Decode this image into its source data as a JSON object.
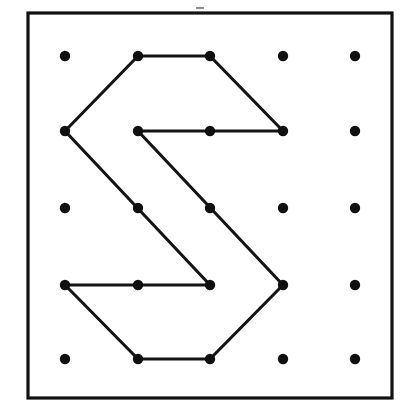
{
  "figure": {
    "canvas": {
      "width": 409,
      "height": 418
    },
    "background_color": "#ffffff",
    "ink_color": "#141414",
    "border": {
      "name": "board-border",
      "x": 28,
      "y": 13,
      "width": 364,
      "height": 385,
      "stroke_color": "#111111",
      "stroke_width": 3.2,
      "fill": "#ffffff"
    },
    "grid": {
      "rows": 5,
      "columns": 5,
      "column_x": [
        65,
        138,
        210,
        283,
        355
      ],
      "row_y": [
        56,
        131,
        208,
        285,
        359
      ],
      "dot_radius": 5.2,
      "dot_color": "#101010",
      "column_spacing": 72.5,
      "row_spacing": 75.75
    },
    "dots": [
      {
        "id": "r1c1",
        "row": 1,
        "col": 1,
        "x": 65,
        "y": 56,
        "on_path": false
      },
      {
        "id": "r1c2",
        "row": 1,
        "col": 2,
        "x": 138,
        "y": 56,
        "on_path": true
      },
      {
        "id": "r1c3",
        "row": 1,
        "col": 3,
        "x": 210,
        "y": 56,
        "on_path": true
      },
      {
        "id": "r1c4",
        "row": 1,
        "col": 4,
        "x": 283,
        "y": 56,
        "on_path": false
      },
      {
        "id": "r1c5",
        "row": 1,
        "col": 5,
        "x": 355,
        "y": 56,
        "on_path": false
      },
      {
        "id": "r2c1",
        "row": 2,
        "col": 1,
        "x": 65,
        "y": 131,
        "on_path": true
      },
      {
        "id": "r2c2",
        "row": 2,
        "col": 2,
        "x": 138,
        "y": 131,
        "on_path": true
      },
      {
        "id": "r2c3",
        "row": 2,
        "col": 3,
        "x": 210,
        "y": 131,
        "on_path": true
      },
      {
        "id": "r2c4",
        "row": 2,
        "col": 4,
        "x": 283,
        "y": 131,
        "on_path": true
      },
      {
        "id": "r2c5",
        "row": 2,
        "col": 5,
        "x": 355,
        "y": 131,
        "on_path": false
      },
      {
        "id": "r3c1",
        "row": 3,
        "col": 1,
        "x": 65,
        "y": 208,
        "on_path": false
      },
      {
        "id": "r3c2",
        "row": 3,
        "col": 2,
        "x": 138,
        "y": 208,
        "on_path": true
      },
      {
        "id": "r3c3",
        "row": 3,
        "col": 3,
        "x": 210,
        "y": 208,
        "on_path": true
      },
      {
        "id": "r3c4",
        "row": 3,
        "col": 4,
        "x": 283,
        "y": 208,
        "on_path": false
      },
      {
        "id": "r3c5",
        "row": 3,
        "col": 5,
        "x": 355,
        "y": 208,
        "on_path": false
      },
      {
        "id": "r4c1",
        "row": 4,
        "col": 1,
        "x": 65,
        "y": 285,
        "on_path": true
      },
      {
        "id": "r4c2",
        "row": 4,
        "col": 2,
        "x": 138,
        "y": 285,
        "on_path": true
      },
      {
        "id": "r4c3",
        "row": 4,
        "col": 3,
        "x": 210,
        "y": 285,
        "on_path": true
      },
      {
        "id": "r4c4",
        "row": 4,
        "col": 4,
        "x": 283,
        "y": 285,
        "on_path": true
      },
      {
        "id": "r4c5",
        "row": 4,
        "col": 5,
        "x": 355,
        "y": 285,
        "on_path": false
      },
      {
        "id": "r5c1",
        "row": 5,
        "col": 1,
        "x": 65,
        "y": 359,
        "on_path": false
      },
      {
        "id": "r5c2",
        "row": 5,
        "col": 2,
        "x": 138,
        "y": 359,
        "on_path": true
      },
      {
        "id": "r5c3",
        "row": 5,
        "col": 3,
        "x": 210,
        "y": 359,
        "on_path": true
      },
      {
        "id": "r5c4",
        "row": 5,
        "col": 4,
        "x": 283,
        "y": 359,
        "on_path": false
      },
      {
        "id": "r5c5",
        "row": 5,
        "col": 5,
        "x": 355,
        "y": 359,
        "on_path": false
      }
    ],
    "polygon": {
      "name": "rubber-band-path",
      "closed": true,
      "stroke_color": "#141414",
      "stroke_width": 3.1,
      "vertex_ids": [
        "r1c2",
        "r1c3",
        "r2c4",
        "r2c2",
        "r4c4",
        "r5c3",
        "r5c2",
        "r4c1",
        "r4c3",
        "r2c1"
      ],
      "points": "138,56 210,56 283,131 138,131 283,285 210,359 138,359 65,285 210,285 65,131",
      "segments": [
        {
          "from": "r1c2",
          "to": "r1c3",
          "x1": 138,
          "y1": 56,
          "x2": 210,
          "y2": 56
        },
        {
          "from": "r1c3",
          "to": "r2c4",
          "x1": 210,
          "y1": 56,
          "x2": 283,
          "y2": 131
        },
        {
          "from": "r2c4",
          "to": "r2c2",
          "x1": 283,
          "y1": 131,
          "x2": 138,
          "y2": 131
        },
        {
          "from": "r2c2",
          "to": "r4c4",
          "x1": 138,
          "y1": 131,
          "x2": 283,
          "y2": 285
        },
        {
          "from": "r4c4",
          "to": "r5c3",
          "x1": 283,
          "y1": 285,
          "x2": 210,
          "y2": 359
        },
        {
          "from": "r5c3",
          "to": "r5c2",
          "x1": 210,
          "y1": 359,
          "x2": 138,
          "y2": 359
        },
        {
          "from": "r5c2",
          "to": "r4c1",
          "x1": 138,
          "y1": 359,
          "x2": 65,
          "y2": 285
        },
        {
          "from": "r4c1",
          "to": "r4c3",
          "x1": 65,
          "y1": 285,
          "x2": 210,
          "y2": 285
        },
        {
          "from": "r4c3",
          "to": "r2c1",
          "x1": 210,
          "y1": 285,
          "x2": 65,
          "y2": 131
        },
        {
          "from": "r2c1",
          "to": "r1c2",
          "x1": 65,
          "y1": 131,
          "x2": 138,
          "y2": 56
        }
      ]
    },
    "speck": {
      "name": "scan-speck",
      "x": 196,
      "y": 7,
      "width": 8,
      "height": 2,
      "color": "#8c8c8c"
    }
  }
}
